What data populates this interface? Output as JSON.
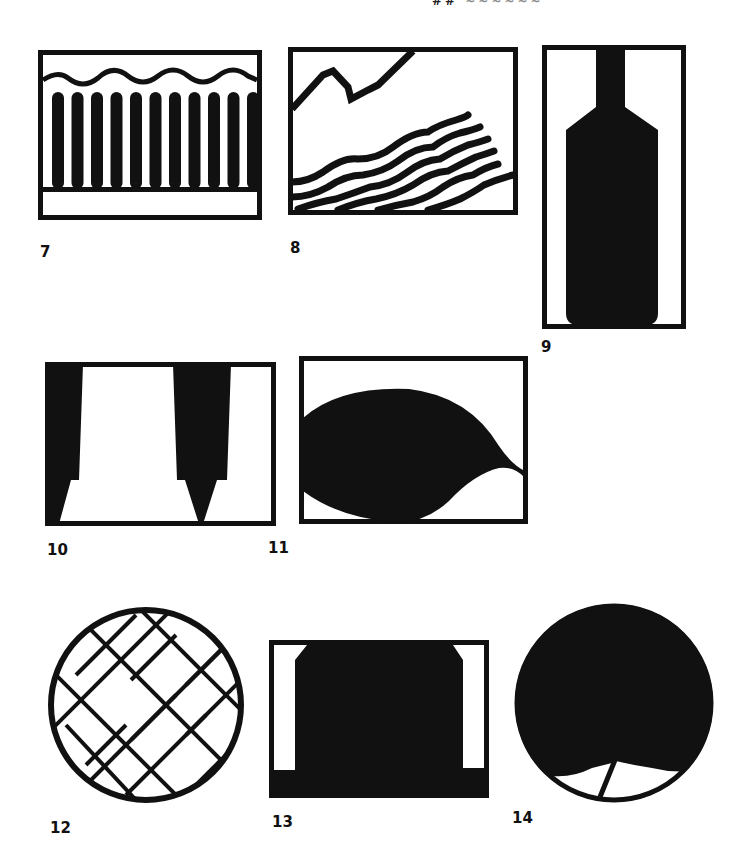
{
  "page": {
    "header_fragment": "##",
    "header_fragment_faint": "~~~~~~"
  },
  "colors": {
    "ink": "#111111",
    "paper": "#ffffff"
  },
  "figures": [
    {
      "number": "7",
      "icon": "waves-over-comb-icon",
      "description": "Wavy line above row of vertical rounded bars on a base"
    },
    {
      "number": "8",
      "icon": "mountain-and-waves-icon",
      "description": "Jagged mountain line with diagonal wavy stripes"
    },
    {
      "number": "9",
      "icon": "bottle-icon",
      "description": "Bottle silhouette inside tall rectangle"
    },
    {
      "number": "10",
      "icon": "tapered-pillars-icon",
      "description": "Two tapering black pillars inside frame"
    },
    {
      "number": "11",
      "icon": "leaf-shape-icon",
      "description": "Leaf or teardrop silhouette inside frame"
    },
    {
      "number": "12",
      "icon": "crosshatch-circle-icon",
      "description": "Circle with diagonal crosshatched lines"
    },
    {
      "number": "13",
      "icon": "block-shape-icon",
      "description": "Solid block with chamfered top corners inside frame"
    },
    {
      "number": "14",
      "icon": "tree-canopy-circle-icon",
      "description": "Filled circle with small trunk and base lines"
    }
  ]
}
